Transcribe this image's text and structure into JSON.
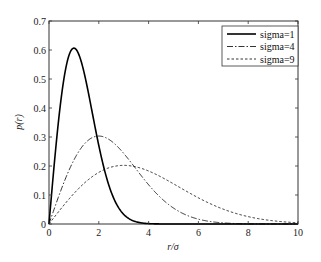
{
  "chart_data": {
    "type": "line",
    "title": "",
    "xlabel": "r/σ",
    "ylabel": "p(r)",
    "xlim": [
      0,
      10
    ],
    "ylim": [
      0,
      0.7
    ],
    "xticks": [
      0,
      2,
      4,
      6,
      8,
      10
    ],
    "yticks": [
      0,
      0.1,
      0.2,
      0.3,
      0.4,
      0.5,
      0.6,
      0.7
    ],
    "xtick_labels": [
      "0",
      "2",
      "4",
      "6",
      "8",
      "10"
    ],
    "ytick_labels": [
      "0",
      "0.1",
      "0.2",
      "0.3",
      "0.4",
      "0.5",
      "0.6",
      "0.7"
    ],
    "grid": false,
    "legend_position": "upper right",
    "x": [
      0,
      0.5,
      1,
      1.5,
      2,
      2.5,
      3,
      3.5,
      4,
      4.5,
      5,
      5.5,
      6,
      6.5,
      7,
      7.5,
      8,
      8.5,
      9,
      9.5,
      10
    ],
    "series": [
      {
        "name": "sigma=1",
        "style": "solid",
        "color": "#000000",
        "values": [
          0,
          0.441,
          0.607,
          0.487,
          0.271,
          0.11,
          0.033,
          0.008,
          0.001,
          0.0,
          0.0,
          0.0,
          0.0,
          0.0,
          0.0,
          0.0,
          0.0,
          0.0,
          0.0,
          0.0,
          0.0
        ]
      },
      {
        "name": "sigma=4",
        "style": "dash-dot",
        "color": "#000000",
        "values": [
          0,
          0.121,
          0.221,
          0.283,
          0.303,
          0.286,
          0.243,
          0.19,
          0.135,
          0.09,
          0.055,
          0.031,
          0.017,
          0.008,
          0.004,
          0.002,
          0.001,
          0.0,
          0.0,
          0.0,
          0.0
        ]
      },
      {
        "name": "sigma=9",
        "style": "dashed",
        "color": "#000000",
        "values": [
          0,
          0.055,
          0.105,
          0.147,
          0.178,
          0.196,
          0.202,
          0.198,
          0.184,
          0.162,
          0.139,
          0.114,
          0.09,
          0.068,
          0.05,
          0.036,
          0.025,
          0.016,
          0.01,
          0.006,
          0.004
        ]
      }
    ]
  }
}
